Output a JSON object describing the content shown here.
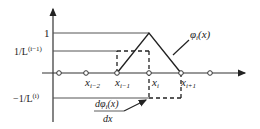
{
  "diagram": {
    "y_labels": {
      "one": "1",
      "inv_prev": {
        "base": "1/L",
        "sup": "(i−1)"
      },
      "neg_inv": {
        "base": "−1/L",
        "sup": "(i)"
      }
    },
    "x_nodes": [
      {
        "label": "",
        "x": 59
      },
      {
        "label": "x",
        "sub": "i−2",
        "x": 86
      },
      {
        "label": "x",
        "sub": "i−1",
        "x": 117
      },
      {
        "label": "x",
        "sub": "i",
        "x": 149
      },
      {
        "label": "x",
        "sub": "i+1",
        "x": 181
      },
      {
        "label": "",
        "x": 210
      }
    ],
    "curve_labels": {
      "phi": {
        "main": "φ",
        "sub": "i",
        "arg": "(x)"
      },
      "dphi": {
        "num": "dφ",
        "num_sub": "i",
        "num_arg": "(x)",
        "den": "dx"
      }
    },
    "colors": {
      "line": "#333333",
      "dash": "#222222"
    }
  }
}
